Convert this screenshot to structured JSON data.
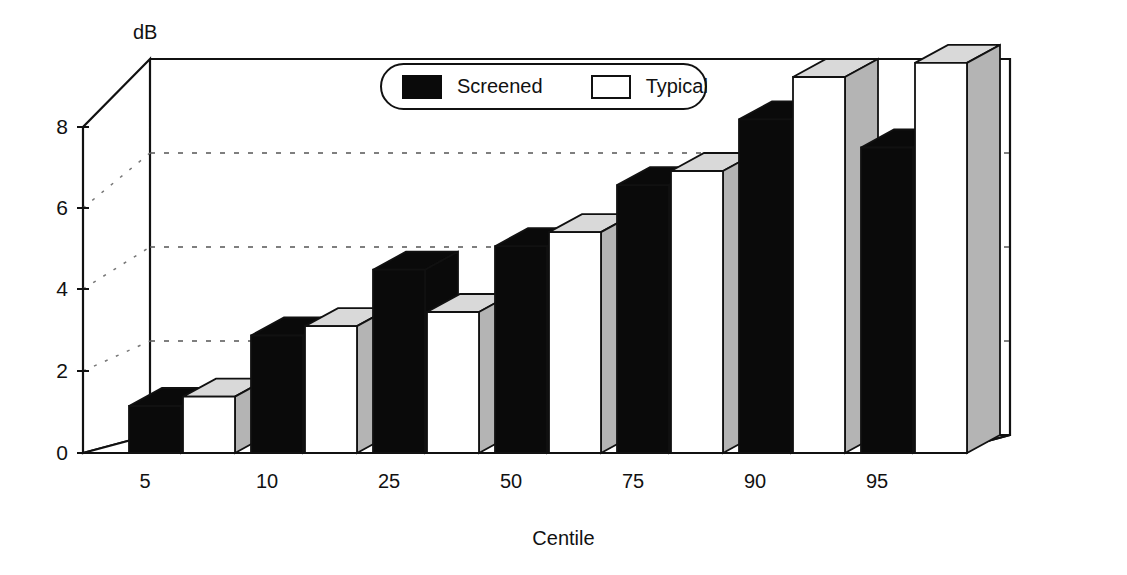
{
  "axes": {
    "y_unit_label": "dB",
    "y_ticks": [
      "0",
      "2",
      "4",
      "6",
      "8"
    ],
    "x_title": "Centile",
    "x_ticks": [
      "5",
      "10",
      "25",
      "50",
      "75",
      "90",
      "95"
    ]
  },
  "legend": {
    "items": [
      {
        "label": "Screened",
        "swatch": "filled-black-swatch-icon",
        "color": "#0a0a0a"
      },
      {
        "label": "Typical",
        "swatch": "outlined-white-swatch-icon",
        "color": "#ffffff"
      }
    ]
  },
  "colors": {
    "screened_face": "#0a0a0a",
    "screened_top": "#0a0a0a",
    "screened_side": "#0a0a0a",
    "typical_face": "#ffffff",
    "typical_top": "#d9d9d9",
    "typical_side": "#b4b4b4",
    "axis": "#111111",
    "gridline": "#555555",
    "background": "#ffffff"
  },
  "chart_data": {
    "type": "bar",
    "title": "",
    "subtitle": "",
    "xlabel": "Centile",
    "ylabel": "dB",
    "categories": [
      "5",
      "10",
      "25",
      "50",
      "75",
      "90",
      "95"
    ],
    "series": [
      {
        "name": "Screened",
        "values": [
          1.0,
          2.5,
          3.9,
          4.4,
          5.7,
          7.1,
          6.5
        ]
      },
      {
        "name": "Typical",
        "values": [
          1.2,
          2.7,
          3.0,
          4.7,
          6.0,
          8.0,
          8.3
        ]
      }
    ],
    "ylim": [
      0,
      8
    ],
    "yticks": [
      0,
      2,
      4,
      6,
      8
    ],
    "gridlines": [
      2,
      4,
      6
    ],
    "grid": true,
    "grid_style": "dotted",
    "legend_position": "top-center",
    "three_d": true,
    "annotations": []
  }
}
